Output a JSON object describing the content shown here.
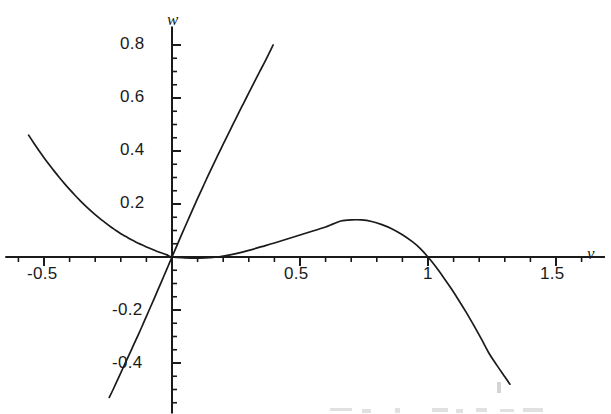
{
  "figure": {
    "width": 611,
    "height": 414,
    "background": "#ffffff",
    "ink_color": "#1a1a1a"
  },
  "axes": {
    "x_axis_name": "v",
    "y_axis_name": "w",
    "origin_px": [
      172,
      257
    ],
    "x_scale_px_per_unit": 256,
    "y_scale_px_per_unit": 265,
    "x_major_ticks": [
      -0.5,
      0.5,
      1,
      1.5
    ],
    "y_major_ticks": [
      0.8,
      0.6,
      0.4,
      0.2,
      -0.2,
      -0.4
    ],
    "x_minor_step": 0.1,
    "y_minor_step": 0.05,
    "x_tick_labels": [
      "-0.5",
      "0.5",
      "1",
      "1.5"
    ],
    "y_tick_labels": [
      "0.8",
      "0.6",
      "0.4",
      "0.2",
      "-0.2",
      "-0.4"
    ]
  },
  "chart_data": {
    "type": "line",
    "title": "",
    "xlabel": "v",
    "ylabel": "w",
    "xlim": [
      -0.62,
      1.66
    ],
    "ylim": [
      -0.56,
      0.84
    ],
    "grid": false,
    "legend": null,
    "axis_style": "crossing-axes-at-origin",
    "series": [
      {
        "name": "cubic-nullcline",
        "description": "Cubic curve w = v(1-v)(v-a) shape: rises from left at w=0.46 near v=-0.56, falls to zero at origin, small positive hump peaking at w=0.14 near v=0.66, crosses zero at v=1 and plunges to w=-0.48 at v=1.32",
        "points": [
          [
            -0.56,
            0.46
          ],
          [
            -0.54,
            0.43
          ],
          [
            -0.52,
            0.402
          ],
          [
            -0.5,
            0.375
          ],
          [
            -0.48,
            0.349
          ],
          [
            -0.46,
            0.324
          ],
          [
            -0.44,
            0.3
          ],
          [
            -0.42,
            0.277
          ],
          [
            -0.4,
            0.255
          ],
          [
            -0.38,
            0.234
          ],
          [
            -0.36,
            0.214
          ],
          [
            -0.34,
            0.195
          ],
          [
            -0.32,
            0.177
          ],
          [
            -0.3,
            0.16
          ],
          [
            -0.28,
            0.144
          ],
          [
            -0.26,
            0.129
          ],
          [
            -0.24,
            0.114
          ],
          [
            -0.22,
            0.101
          ],
          [
            -0.2,
            0.088
          ],
          [
            -0.18,
            0.077
          ],
          [
            -0.16,
            0.066
          ],
          [
            -0.14,
            0.056
          ],
          [
            -0.12,
            0.047
          ],
          [
            -0.1,
            0.038
          ],
          [
            -0.08,
            0.03
          ],
          [
            -0.06,
            0.022
          ],
          [
            -0.04,
            0.015
          ],
          [
            -0.02,
            0.008
          ],
          [
            0.0,
            0.0
          ],
          [
            0.05,
            -0.003
          ],
          [
            0.1,
            -0.004
          ],
          [
            0.15,
            -0.002
          ],
          [
            0.18,
            0.0
          ],
          [
            0.2,
            0.003
          ],
          [
            0.25,
            0.013
          ],
          [
            0.3,
            0.025
          ],
          [
            0.35,
            0.039
          ],
          [
            0.4,
            0.053
          ],
          [
            0.45,
            0.068
          ],
          [
            0.5,
            0.083
          ],
          [
            0.55,
            0.098
          ],
          [
            0.6,
            0.113
          ],
          [
            0.63,
            0.125
          ],
          [
            0.66,
            0.136
          ],
          [
            0.7,
            0.14
          ],
          [
            0.74,
            0.14
          ],
          [
            0.78,
            0.134
          ],
          [
            0.82,
            0.122
          ],
          [
            0.86,
            0.106
          ],
          [
            0.9,
            0.084
          ],
          [
            0.94,
            0.057
          ],
          [
            0.97,
            0.032
          ],
          [
            1.0,
            0.0
          ],
          [
            1.03,
            -0.036
          ],
          [
            1.06,
            -0.076
          ],
          [
            1.09,
            -0.118
          ],
          [
            1.12,
            -0.163
          ],
          [
            1.15,
            -0.21
          ],
          [
            1.18,
            -0.26
          ],
          [
            1.21,
            -0.312
          ],
          [
            1.24,
            -0.366
          ],
          [
            1.27,
            -0.41
          ],
          [
            1.3,
            -0.452
          ],
          [
            1.32,
            -0.48
          ]
        ]
      },
      {
        "name": "steep-nullcline",
        "description": "Steep nearly-linear curve through the origin with slope about 2.2, running from lower-left to upper-right",
        "points": [
          [
            -0.245,
            -0.53
          ],
          [
            -0.23,
            -0.5
          ],
          [
            -0.21,
            -0.458
          ],
          [
            -0.19,
            -0.416
          ],
          [
            -0.17,
            -0.374
          ],
          [
            -0.15,
            -0.332
          ],
          [
            -0.13,
            -0.29
          ],
          [
            -0.11,
            -0.246
          ],
          [
            -0.09,
            -0.202
          ],
          [
            -0.07,
            -0.158
          ],
          [
            -0.05,
            -0.113
          ],
          [
            -0.03,
            -0.068
          ],
          [
            -0.015,
            -0.034
          ],
          [
            0.0,
            0.0
          ],
          [
            0.02,
            0.045
          ],
          [
            0.04,
            0.09
          ],
          [
            0.06,
            0.134
          ],
          [
            0.08,
            0.178
          ],
          [
            0.1,
            0.221
          ],
          [
            0.12,
            0.263
          ],
          [
            0.14,
            0.305
          ],
          [
            0.16,
            0.346
          ],
          [
            0.18,
            0.386
          ],
          [
            0.2,
            0.426
          ],
          [
            0.22,
            0.465
          ],
          [
            0.24,
            0.504
          ],
          [
            0.26,
            0.543
          ],
          [
            0.28,
            0.581
          ],
          [
            0.3,
            0.619
          ],
          [
            0.32,
            0.657
          ],
          [
            0.34,
            0.695
          ],
          [
            0.36,
            0.732
          ],
          [
            0.38,
            0.77
          ],
          [
            0.395,
            0.8
          ]
        ]
      }
    ]
  }
}
